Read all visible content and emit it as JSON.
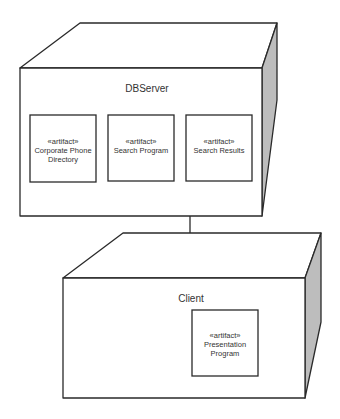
{
  "diagram": {
    "type": "UML deployment diagram",
    "nodes": [
      {
        "name": "DBServer",
        "artifacts": [
          {
            "stereotype": "«artifact»",
            "lines": [
              "Corporate Phone",
              "Directory"
            ]
          },
          {
            "stereotype": "«artifact»",
            "lines": [
              "Search Program"
            ]
          },
          {
            "stereotype": "«artifact»",
            "lines": [
              "Search Results"
            ]
          }
        ]
      },
      {
        "name": "Client",
        "artifacts": [
          {
            "stereotype": "«artifact»",
            "lines": [
              "Presentation",
              "Program"
            ]
          }
        ]
      }
    ],
    "connections": [
      {
        "from": "DBServer",
        "to": "Client"
      }
    ]
  },
  "colors": {
    "line": "#2a2a2a",
    "side_shade": "#bdbdbd",
    "face": "#ffffff"
  }
}
